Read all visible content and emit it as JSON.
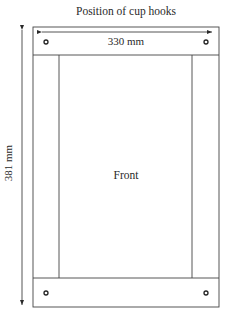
{
  "diagram": {
    "title": "Position of cup hooks",
    "width_label": "330 mm",
    "height_label": "381 mm",
    "center_label": "Front",
    "stroke_color": "#3a3a3a"
  }
}
